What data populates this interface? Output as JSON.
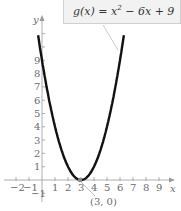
{
  "chart_data": {
    "type": "line",
    "title": "",
    "function_label": "g(x) = x² − 6x + 9",
    "xlabel": "x",
    "ylabel": "y",
    "x_ticks": [
      -2,
      -1,
      1,
      2,
      3,
      4,
      5,
      6,
      7,
      8,
      9
    ],
    "y_ticks": [
      -1,
      1,
      2,
      3,
      4,
      5,
      6,
      7,
      8,
      9
    ],
    "xlim": [
      -2.5,
      10
    ],
    "ylim": [
      -1.5,
      11
    ],
    "annotations": [
      {
        "text": "(3, 0)",
        "x": 3,
        "y": 0,
        "label": "vertex"
      }
    ],
    "series": [
      {
        "name": "g(x)",
        "x": [
          -0.3,
          0,
          1,
          2,
          3,
          4,
          5,
          6,
          6.3
        ],
        "y": [
          10.89,
          9,
          4,
          1,
          0,
          1,
          4,
          9,
          10.89
        ]
      }
    ],
    "grid": false
  },
  "labels": {
    "equation_prefix": "g(x) = x",
    "equation_exp": "2",
    "equation_suffix": " − 6x + 9",
    "vertex": "(3, 0)",
    "x_axis": "x",
    "y_axis": "y"
  }
}
